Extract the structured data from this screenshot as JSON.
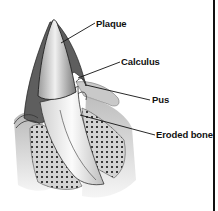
{
  "diagram": {
    "labels": [
      {
        "id": "plaque",
        "text": "Plaque"
      },
      {
        "id": "calculus",
        "text": "Calculus"
      },
      {
        "id": "pus",
        "text": "Pus"
      },
      {
        "id": "eroded_bone",
        "text": "Eroded bone"
      }
    ]
  },
  "colors": {
    "background": "#ffffff",
    "ink": "#111111",
    "enamel": "#d9d9d9",
    "root": "#f4f4f4",
    "calculus": "#5a5a5a",
    "bone": "#bdbdbd",
    "gum": "#cfcfcf"
  }
}
